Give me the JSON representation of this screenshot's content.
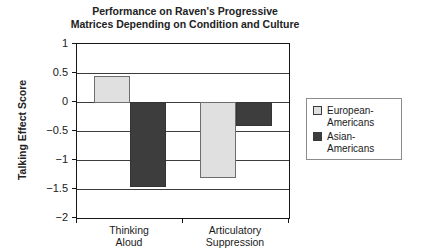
{
  "chart_data": {
    "type": "bar",
    "title": "Performance on Raven's Progressive Matrices Depending on Condition and Culture",
    "title_lines": [
      "Performance on Raven's Progressive",
      "Matrices Depending on Condition and Culture"
    ],
    "xlabel": "",
    "ylabel": "Talking Effect Score",
    "ylim": [
      -2,
      1
    ],
    "ytick_step": 0.5,
    "grid": true,
    "legend_position": "right",
    "categories": [
      "Thinking Aloud",
      "Articulatory Suppression"
    ],
    "category_label_lines": [
      [
        "Thinking",
        "Aloud"
      ],
      [
        "Articulatory",
        "Suppression"
      ]
    ],
    "yticks": [
      {
        "value": 1,
        "label": "1"
      },
      {
        "value": 0.5,
        "label": "0.5"
      },
      {
        "value": 0,
        "label": "0"
      },
      {
        "value": -0.5,
        "label": "−0.5"
      },
      {
        "value": -1,
        "label": "−1"
      },
      {
        "value": -1.5,
        "label": "−1.5"
      },
      {
        "value": -2,
        "label": "−2"
      }
    ],
    "series": [
      {
        "name": "European-Americans",
        "label_lines": [
          "European-",
          "Americans"
        ],
        "values": [
          0.45,
          -1.3
        ],
        "fill": "#e0e0e0",
        "border": "#6e6e6e"
      },
      {
        "name": "Asian-Americans",
        "label_lines": [
          "Asian-Americans"
        ],
        "values": [
          -1.45,
          -0.4
        ],
        "fill": "#3d3d3d",
        "border": "#343434"
      }
    ]
  },
  "colors": {
    "background": "#ffffff",
    "plot_border": "#161616",
    "gridline": "#3c3c3c",
    "legend_border": "#8c8c8c",
    "text": "#1a1a1a"
  }
}
